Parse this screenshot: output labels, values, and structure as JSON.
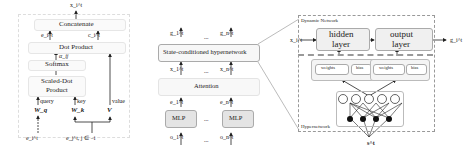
{
  "left_panel": {
    "output": "x_i^t",
    "concatenate": "Concatenate",
    "e_label": "e_i^t",
    "c_label": "c_i^t",
    "dot_product": "Dot Product",
    "alpha": "α_ij",
    "softmax": "Softmax",
    "scaled_dot_1": "Scaled-Dot",
    "scaled_dot_2": "Product",
    "query": "query",
    "key": "key",
    "value": "value",
    "wq": "W_q",
    "wk": "W_k",
    "v": "V",
    "input_i": "e_i^t",
    "input_j": "e_j^t, j ∈ −i"
  },
  "middle_panel": {
    "g1": "g_1^t",
    "gn": "g_n^t",
    "ellipsis": "...",
    "hyper": "State-conditioned hypernetwork",
    "x1": "x_1^t",
    "xn": "x_n^t",
    "attention": "Attention",
    "e1": "e_1^t",
    "en": "e_n^t",
    "mlp1": "MLP",
    "mlpn": "MLP",
    "o1": "o_1^t",
    "on": "o_n^t"
  },
  "right_panel": {
    "dynamic_title": "Dynamic Network",
    "hidden_1": "hidden",
    "hidden_2": "layer",
    "output_1": "output",
    "output_2": "layer",
    "input": "x_i^t",
    "output": "g_i^t",
    "weights1": "weights",
    "bias1": "bias",
    "weights2": "weights",
    "bias2": "bias",
    "hyper_title": "Hypernetwork",
    "state": "s^t"
  }
}
